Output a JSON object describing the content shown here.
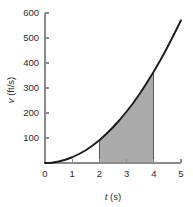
{
  "chart_data": {
    "type": "area",
    "title": "",
    "subtitle": "",
    "xlabel": "t (s)",
    "xlabel_symbol": "t",
    "xlabel_unit": "(s)",
    "ylabel": "v (ft/s)",
    "ylabel_symbol": "v",
    "ylabel_unit": "(ft/s)",
    "xlim": [
      0,
      5
    ],
    "ylim": [
      0,
      600
    ],
    "xticks": [
      0,
      1,
      2,
      3,
      4,
      5
    ],
    "xtick_labels": [
      "0",
      "1",
      "2",
      "3",
      "4",
      "5"
    ],
    "yticks": [
      100,
      200,
      300,
      400,
      500,
      600
    ],
    "ytick_labels": [
      "100",
      "200",
      "300",
      "400",
      "500",
      "600"
    ],
    "grid": false,
    "legend": false,
    "legend_position": "none",
    "series": [
      {
        "name": "v(t)",
        "type": "line",
        "color": "#1a1a1a",
        "x": [
          0.0,
          0.25,
          0.5,
          0.75,
          1.0,
          1.25,
          1.5,
          1.75,
          2.0,
          2.25,
          2.5,
          2.75,
          3.0,
          3.25,
          3.5,
          3.75,
          4.0,
          4.25,
          4.5,
          4.75,
          5.0
        ],
        "values": [
          0,
          1,
          6,
          13,
          23,
          36,
          51,
          70,
          91,
          116,
          143,
          173,
          206,
          241,
          280,
          322,
          366,
          413,
          463,
          516,
          571
        ]
      }
    ],
    "shaded_region": {
      "label": "area under curve",
      "x_start": 2,
      "x_end": 4,
      "y_at_x_start": 91,
      "y_at_x_end": 366,
      "fill_color": "#ababab",
      "edge_color": "#5a5a5a"
    },
    "axis_color": "#8c8c8c",
    "text_color": "#2b2b2b",
    "background_color": "#ffffff"
  }
}
